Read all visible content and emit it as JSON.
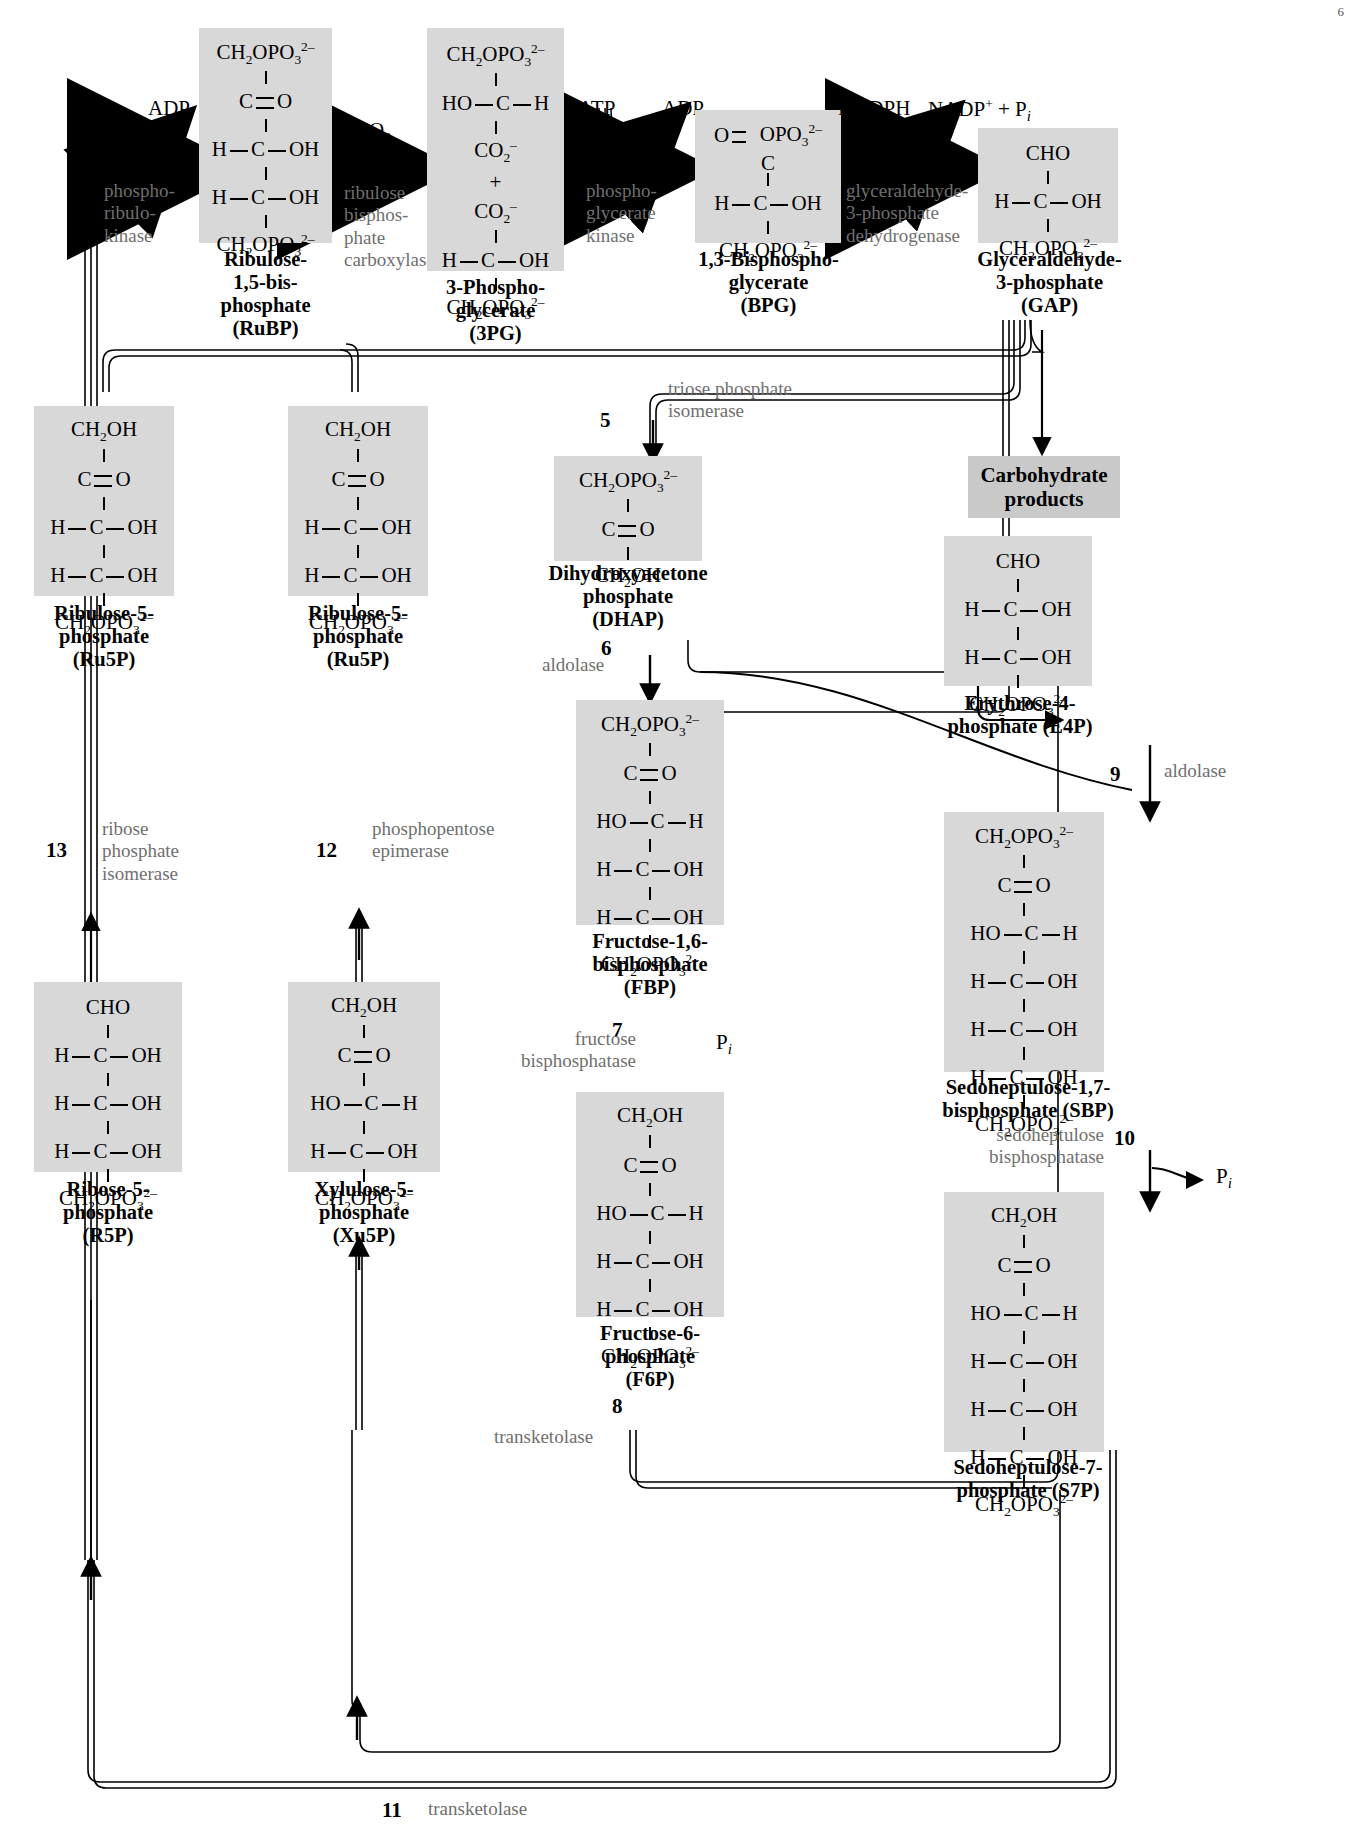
{
  "diagram": {
    "shade_color": "#d8d8d8",
    "enzyme_color": "#6f6f6f"
  },
  "cofactors": {
    "atp1": "ATP",
    "adp1": "ADP",
    "co2": "CO₂",
    "atp3": "ATP",
    "adp3": "ADP",
    "nadph": "NADPH",
    "nadp_pi": "NADP+ + Pi",
    "pi7": "Pi",
    "pi10": "Pi"
  },
  "steps": [
    {
      "n": "1",
      "enzyme": "phospho-\nribulo-\nkinase"
    },
    {
      "n": "2",
      "enzyme": "ribulose\nbisphos-\nphate\ncarboxylase"
    },
    {
      "n": "3",
      "enzyme": "phospho-\nglycerate\nkinase"
    },
    {
      "n": "4",
      "enzyme": "glyceraldehyde-\n3-phosphate\ndehydrogenase"
    },
    {
      "n": "5",
      "enzyme": "triose phosphate\nisomerase"
    },
    {
      "n": "6",
      "enzyme": "aldolase"
    },
    {
      "n": "7",
      "enzyme": "fructose\nbisphosphatase"
    },
    {
      "n": "8",
      "enzyme": "transketolase"
    },
    {
      "n": "9",
      "enzyme": "aldolase"
    },
    {
      "n": "10",
      "enzyme": "sedoheptulose\nbisphosphatase"
    },
    {
      "n": "11",
      "enzyme": "transketolase"
    },
    {
      "n": "12",
      "enzyme": "phosphopentose\nepimerase"
    },
    {
      "n": "13",
      "enzyme": "ribose\nphosphate\nisomerase"
    }
  ],
  "step_labels": {
    "s1": "1",
    "s2": "2",
    "s3": "3",
    "s4": "4",
    "s5": "5",
    "s6": "6",
    "s7": "7",
    "s8": "8",
    "s9": "9",
    "s10": "10",
    "s11": "11",
    "s12": "12",
    "s13": "13"
  },
  "enzymes": {
    "e1_l1": "phospho-",
    "e1_l2": "ribulo-",
    "e1_l3": "kinase",
    "e2_l1": "ribulose",
    "e2_l2": "bisphos-",
    "e2_l3": "phate",
    "e2_l4": "carboxylase",
    "e3_l1": "phospho-",
    "e3_l2": "glycerate",
    "e3_l3": "kinase",
    "e4_l1": "glyceraldehyde-",
    "e4_l2": "3-phosphate",
    "e4_l3": "dehydrogenase",
    "e5_l1": "triose phosphate",
    "e5_l2": "isomerase",
    "e6": "aldolase",
    "e7_l1": "fructose",
    "e7_l2": "bisphosphatase",
    "e8": "transketolase",
    "e9": "aldolase",
    "e10_l1": "sedoheptulose",
    "e10_l2": "bisphosphatase",
    "e11": "transketolase",
    "e12_l1": "phosphopentose",
    "e12_l2": "epimerase",
    "e13_l1": "ribose",
    "e13_l2": "phosphate",
    "e13_l3": "isomerase"
  },
  "metabolites": {
    "rubp": {
      "name_l1": "Ribulose-",
      "name_l2": "1,5-bis-",
      "name_l3": "phosphate",
      "name_l4": "(RuBP)"
    },
    "pg3": {
      "name_l1": "3-Phospho-",
      "name_l2": "glycerate",
      "name_l3": "(3PG)"
    },
    "bpg": {
      "name_l1": "1,3-Bisphospho-",
      "name_l2": "glycerate",
      "name_l3": "(BPG)"
    },
    "gap": {
      "name_l1": "Glyceraldehyde-",
      "name_l2": "3-phosphate",
      "name_l3": "(GAP)"
    },
    "ru5p_a": {
      "name_l1": "Ribulose-5-",
      "name_l2": "phosphate",
      "name_l3": "(Ru5P)"
    },
    "ru5p_b": {
      "name_l1": "Ribulose-5-",
      "name_l2": "phosphate",
      "name_l3": "(Ru5P)"
    },
    "dhap": {
      "name_l1": "Dihydroxyacetone",
      "name_l2": "phosphate",
      "name_l3": "(DHAP)"
    },
    "e4p": {
      "name_l1": "Erythrose-4-",
      "name_l2": "phosphate (E4P)"
    },
    "fbp": {
      "name_l1": "Fructose-1,6-",
      "name_l2": "bisphosphate",
      "name_l3": "(FBP)"
    },
    "sbp": {
      "name_l1": "Sedoheptulose-1,7-",
      "name_l2": "bisphosphate (SBP)"
    },
    "f6p": {
      "name_l1": "Fructose-6-",
      "name_l2": "phosphate",
      "name_l3": "(F6P)"
    },
    "s7p": {
      "name_l1": "Sedoheptulose-7-",
      "name_l2": "phosphate (S7P)"
    },
    "r5p": {
      "name_l1": "Ribose-5-",
      "name_l2": "phosphate",
      "name_l3": "(R5P)"
    },
    "xu5p": {
      "name_l1": "Xylulose-5-",
      "name_l2": "phosphate",
      "name_l3": "(Xu5P)"
    }
  },
  "products": {
    "l1": "Carbohydrate",
    "l2": "products"
  },
  "page_number": "6"
}
